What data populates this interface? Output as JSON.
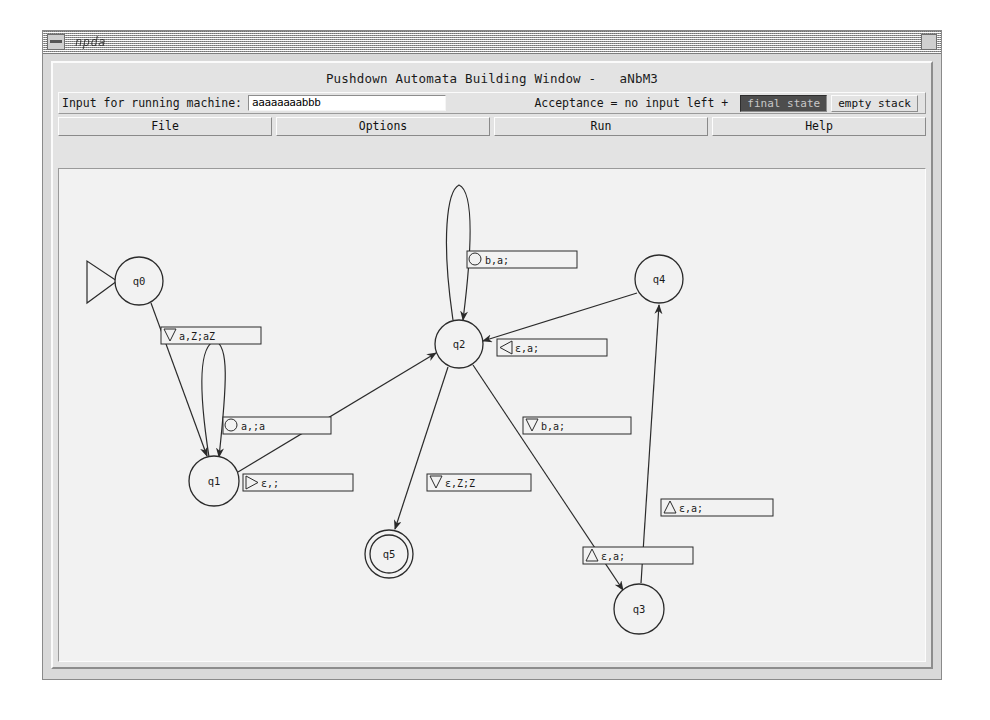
{
  "window": {
    "title": "npda",
    "menu_icon": "window-menu-icon",
    "close_icon": "window-close-icon"
  },
  "app": {
    "heading": "Pushdown Automata Building Window -   aNbM3"
  },
  "controls": {
    "input_label": "Input for running machine:",
    "input_value": "aaaaaaaabbb",
    "input_placeholder": "",
    "acceptance_label": "Acceptance = no input left +",
    "acceptance_options": [
      {
        "label": "final state",
        "selected": true
      },
      {
        "label": "empty stack",
        "selected": false
      }
    ]
  },
  "menubar": {
    "items": [
      {
        "label": "File"
      },
      {
        "label": "Options"
      },
      {
        "label": "Run"
      },
      {
        "label": "Help"
      }
    ]
  },
  "automaton": {
    "states": [
      {
        "id": "q0",
        "label": "q0",
        "cx": 80,
        "cy": 112,
        "r": 24,
        "accepting": false,
        "start": true
      },
      {
        "id": "q1",
        "label": "q1",
        "cx": 155,
        "cy": 312,
        "r": 25,
        "accepting": false,
        "start": false
      },
      {
        "id": "q2",
        "label": "q2",
        "cx": 400,
        "cy": 175,
        "r": 24,
        "accepting": false,
        "start": false
      },
      {
        "id": "q3",
        "label": "q3",
        "cx": 580,
        "cy": 440,
        "r": 25,
        "accepting": false,
        "start": false
      },
      {
        "id": "q4",
        "label": "q4",
        "cx": 600,
        "cy": 110,
        "r": 24,
        "accepting": false,
        "start": false
      },
      {
        "id": "q5",
        "label": "q5",
        "cx": 330,
        "cy": 385,
        "r": 24,
        "accepting": true,
        "start": false
      }
    ],
    "transitions": [
      {
        "from": "q0",
        "to": "q1",
        "label": "a,Z;aZ",
        "marker": "triangle-down",
        "box_x": 102,
        "box_y": 158,
        "box_w": 100
      },
      {
        "from": "q1",
        "to": "q1",
        "label": "a,;a",
        "marker": "circle",
        "box_x": 164,
        "box_y": 248,
        "box_w": 108
      },
      {
        "from": "q1",
        "to": "q2",
        "label": "ε,;",
        "marker": "triangle-right",
        "box_x": 184,
        "box_y": 305,
        "box_w": 110
      },
      {
        "from": "q2",
        "to": "q2",
        "label": "b,a;",
        "marker": "circle",
        "box_x": 408,
        "box_y": 82,
        "box_w": 110
      },
      {
        "from": "q4",
        "to": "q2",
        "label": "ε,a;",
        "marker": "triangle-left",
        "box_x": 438,
        "box_y": 170,
        "box_w": 110
      },
      {
        "from": "q2",
        "to": "q3",
        "label": "b,a;",
        "marker": "triangle-down",
        "box_x": 464,
        "box_y": 248,
        "box_w": 108
      },
      {
        "from": "q2",
        "to": "q5",
        "label": "ε,Z;Z",
        "marker": "triangle-down",
        "box_x": 368,
        "box_y": 305,
        "box_w": 104
      },
      {
        "from": "q3",
        "to": "q4",
        "label": "ε,a;",
        "marker": "triangle-up",
        "box_x": 602,
        "box_y": 330,
        "box_w": 112
      },
      {
        "from": "q3",
        "to": "q3",
        "label": "ε,a;",
        "marker": "triangle-up",
        "box_x": 524,
        "box_y": 378,
        "box_w": 110
      }
    ]
  }
}
